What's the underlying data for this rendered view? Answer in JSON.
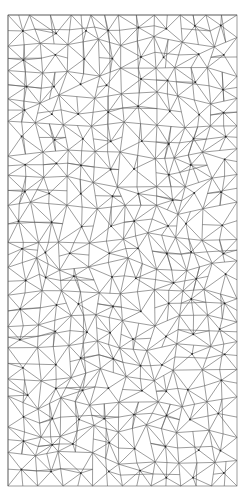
{
  "image": {
    "description": "Black-and-white triangulated mesh tessellation pattern",
    "width": 251,
    "height": 501,
    "background": "#ffffff"
  },
  "mesh": {
    "frame": {
      "x": 8,
      "y": 15,
      "width": 229,
      "height": 471
    },
    "stroke_color": "#5a5a5a",
    "stroke_width": 0.6,
    "node_color": "#222222",
    "node_radius": 0.9,
    "grid_cols": 8,
    "grid_rows": 17,
    "seed": 7
  }
}
